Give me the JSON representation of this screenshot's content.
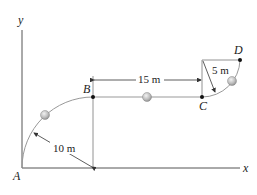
{
  "diagram": {
    "axes": {
      "x_label": "x",
      "y_label": "y"
    },
    "points": {
      "A": "A",
      "B": "B",
      "C": "C",
      "D": "D"
    },
    "dimensions": {
      "radius_AB": "10 m",
      "length_BC": "15 m",
      "radius_CD": "5 m"
    },
    "colors": {
      "line": "#555555",
      "path": "#999999",
      "ball_fill": "#bdbdbd",
      "point": "#111111"
    }
  }
}
